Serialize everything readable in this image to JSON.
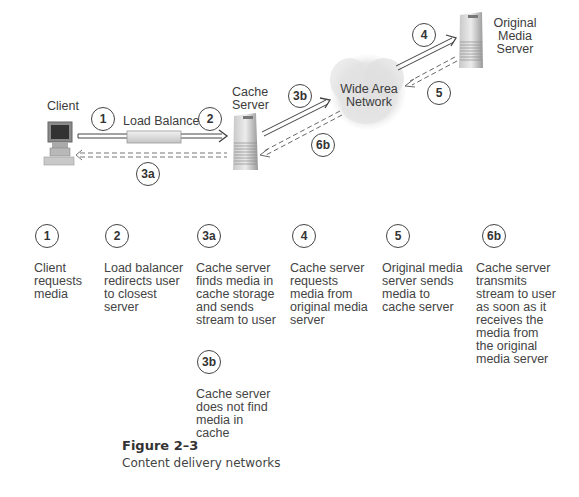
{
  "diagram": {
    "nodes": {
      "client": "Client",
      "load_balancer": "Load Balancer",
      "cache_server": [
        "Cache",
        "Server"
      ],
      "wan": [
        "Wide Area",
        "Network"
      ],
      "origin": [
        "Original",
        "Media",
        "Server"
      ]
    },
    "flow_markers": {
      "m1": "1",
      "m2": "2",
      "m3a": "3a",
      "m3b": "3b",
      "m4": "4",
      "m5": "5",
      "m6b": "6b"
    }
  },
  "steps": [
    {
      "id": "1",
      "text": "Client\nrequests\nmedia"
    },
    {
      "id": "2",
      "text": "Load balancer\nredirects user\nto closest\nserver"
    },
    {
      "id": "3a",
      "text": "Cache server\nfinds media in\ncache storage\nand sends\nstream to user"
    },
    {
      "id": "4",
      "text": "Cache server\nrequests\nmedia from\noriginal media\nserver"
    },
    {
      "id": "5",
      "text": "Original media\nserver sends\nmedia to\ncache server"
    },
    {
      "id": "6b",
      "text": "Cache server\ntransmits\nstream to user\nas soon as it\nreceives the\nmedia from\nthe original\nmedia server"
    },
    {
      "id": "3b",
      "text": "Cache server\ndoes not find\nmedia in\ncache"
    }
  ],
  "caption": {
    "title": "Figure 2–3",
    "subtitle": "Content delivery networks"
  }
}
